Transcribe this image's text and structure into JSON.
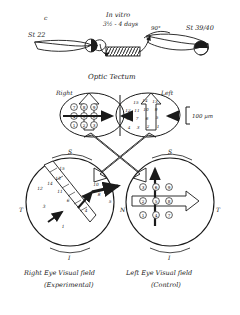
{
  "figure": {
    "panel_label": "c",
    "scale_bar": "100 µm",
    "tectum_title": "Optic Tectum"
  },
  "top_row": {
    "stage_left": "St 22",
    "stage_right": "St 39/40",
    "culture_line1": "In vitro",
    "culture_line2": "3½ - 4 days",
    "rotation_label": "90°"
  },
  "tectum": {
    "right_label": "Right",
    "left_label": "Left",
    "right_half_grid": [
      [
        "7",
        "8",
        "9"
      ],
      [
        "4",
        "5",
        "6"
      ],
      [
        "1",
        "2",
        "3"
      ]
    ],
    "left_half_grid": [
      [
        "",
        "15",
        "14",
        "13"
      ],
      [
        "12",
        "11",
        "10",
        "9"
      ],
      [
        "8",
        "7",
        "6",
        "5"
      ],
      [
        "4",
        "3",
        "2",
        "1"
      ]
    ]
  },
  "eyes": {
    "right_eye": {
      "caption_line1": "Right Eye Visual field",
      "caption_line2": "(Experimental)",
      "axis_top": "S",
      "axis_side": "T",
      "axis_bottom": "I",
      "numbers": [
        "15",
        "13",
        "14",
        "12",
        "11",
        "10",
        "9",
        "8",
        "7",
        "6",
        "5",
        "4",
        "3",
        "2",
        "1"
      ]
    },
    "left_eye": {
      "caption_line1": "Left Eye Visual field",
      "caption_line2": "(Control)",
      "axis_top": "S",
      "axis_side_left": "N",
      "axis_side_right": "T",
      "axis_bottom": "I",
      "grid": [
        [
          "3",
          "6",
          "9"
        ],
        [
          "2",
          "5",
          "8"
        ],
        [
          "1",
          "4",
          "7"
        ]
      ]
    }
  },
  "colors": {
    "ink": "#1a1a1a",
    "paper": "#ffffff"
  }
}
